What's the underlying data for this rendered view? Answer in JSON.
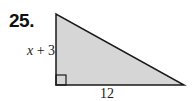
{
  "problem": {
    "number": "25.",
    "figure": "right-triangle",
    "sides": {
      "vertical_leg": {
        "var": "x",
        "rest": " + 3"
      },
      "horizontal_leg": "12"
    },
    "colors": {
      "fill": "#d6d6d6",
      "stroke": "#1a1a1a"
    }
  }
}
